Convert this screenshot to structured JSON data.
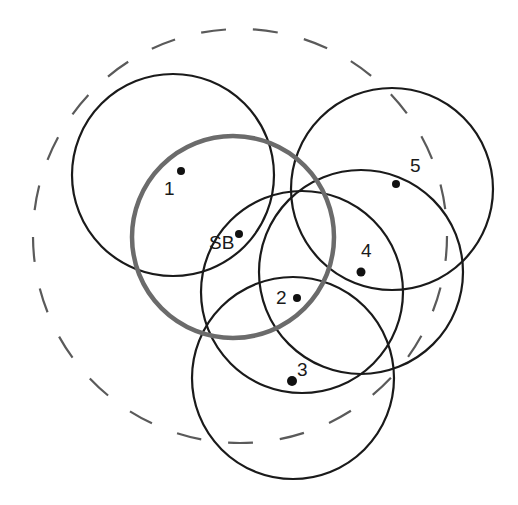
{
  "diagram": {
    "title": "",
    "colors": {
      "range_stroke": "#1a1a1a",
      "sb_range_stroke": "#6b6b6b",
      "dashed_stroke": "#5a5a5a",
      "background": "#ffffff"
    },
    "outer_dashed_circle": {
      "cx": 240,
      "cy": 236,
      "r": 207
    },
    "sb_circle": {
      "cx": 233,
      "cy": 237,
      "r": 101
    },
    "nodes": [
      {
        "id": "1",
        "label": "1",
        "dot": {
          "x": 181,
          "y": 171
        },
        "label_pos": {
          "x": 164,
          "y": 195
        },
        "circle": {
          "cx": 173,
          "cy": 175,
          "r": 101
        }
      },
      {
        "id": "SB",
        "label": "SB",
        "dot": {
          "x": 239,
          "y": 234
        },
        "label_pos": {
          "x": 209,
          "y": 249
        }
      },
      {
        "id": "2",
        "label": "2",
        "dot": {
          "x": 297,
          "y": 298
        },
        "label_pos": {
          "x": 276,
          "y": 304
        },
        "circle": {
          "cx": 302,
          "cy": 292,
          "r": 101
        }
      },
      {
        "id": "3",
        "label": "3",
        "dot": {
          "x": 292,
          "y": 381
        },
        "label_pos": {
          "x": 297,
          "y": 376
        },
        "circle": {
          "cx": 293,
          "cy": 378,
          "r": 101
        }
      },
      {
        "id": "4",
        "label": "4",
        "dot": {
          "x": 361,
          "y": 272
        },
        "label_pos": {
          "x": 361,
          "y": 257
        },
        "circle": {
          "cx": 361,
          "cy": 272,
          "r": 102
        }
      },
      {
        "id": "5",
        "label": "5",
        "dot": {
          "x": 396,
          "y": 184
        },
        "label_pos": {
          "x": 410,
          "y": 172
        },
        "circle": {
          "cx": 392,
          "cy": 189,
          "r": 101
        }
      }
    ]
  }
}
